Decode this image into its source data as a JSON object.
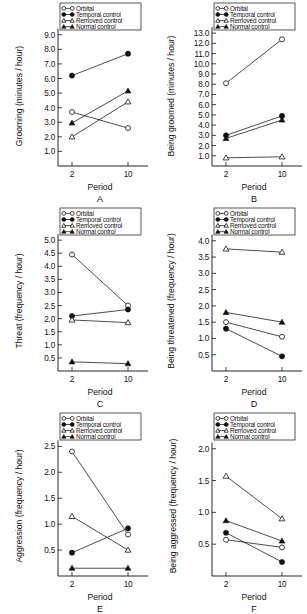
{
  "figure": {
    "series_names": [
      "Orbital",
      "Temporal control",
      "Removed control",
      "Normal control"
    ],
    "markers": [
      "open-circle",
      "filled-circle",
      "open-triangle",
      "filled-triangle"
    ],
    "x_label": "Period",
    "x_ticks": [
      "2",
      "10"
    ],
    "line_color": "#111111"
  },
  "chart_data": [
    {
      "type": "line",
      "panel": "A",
      "title": "",
      "xlabel": "Period",
      "ylabel": "Grooming (minutes / hour)",
      "x": [
        2,
        10
      ],
      "xtick_labels": [
        "2",
        "10"
      ],
      "ytick_labels": [
        "1.0",
        "2.0",
        "3.0",
        "4.0",
        "5.0",
        "6.0",
        "7.0",
        "8.0",
        "9.0"
      ],
      "yticks": [
        1.0,
        2.0,
        3.0,
        4.0,
        5.0,
        6.0,
        7.0,
        8.0,
        9.0
      ],
      "ylim": [
        0.0,
        9.6
      ],
      "grid": false,
      "legend_position": "top-left",
      "series": [
        {
          "name": "Orbital",
          "marker": "open-circle",
          "values": [
            3.7,
            2.6
          ]
        },
        {
          "name": "Temporal control",
          "marker": "filled-circle",
          "values": [
            6.2,
            7.7
          ]
        },
        {
          "name": "Removed control",
          "marker": "open-triangle",
          "values": [
            2.0,
            4.4
          ]
        },
        {
          "name": "Normal control",
          "marker": "filled-triangle",
          "values": [
            2.95,
            5.15
          ]
        }
      ]
    },
    {
      "type": "line",
      "panel": "B",
      "title": "",
      "xlabel": "Period",
      "ylabel": "Being groomed (minutes / hour)",
      "x": [
        2,
        10
      ],
      "xtick_labels": [
        "2",
        "10"
      ],
      "ytick_labels": [
        "1.0",
        "2.0",
        "3.0",
        "4.0",
        "5.0",
        "6.0",
        "7.0",
        "8.0",
        "9.0",
        "10.0",
        "11.0",
        "12.0",
        "13.0"
      ],
      "yticks": [
        1.0,
        2.0,
        3.0,
        4.0,
        5.0,
        6.0,
        7.0,
        8.0,
        9.0,
        10.0,
        11.0,
        12.0,
        13.0
      ],
      "ylim": [
        0.0,
        13.7
      ],
      "grid": false,
      "legend_position": "top-left",
      "series": [
        {
          "name": "Orbital",
          "marker": "open-circle",
          "values": [
            8.1,
            12.4
          ]
        },
        {
          "name": "Temporal control",
          "marker": "filled-circle",
          "values": [
            3.0,
            4.9
          ]
        },
        {
          "name": "Removed control",
          "marker": "open-triangle",
          "values": [
            0.8,
            0.9
          ]
        },
        {
          "name": "Normal control",
          "marker": "filled-triangle",
          "values": [
            2.7,
            4.5
          ]
        }
      ]
    },
    {
      "type": "line",
      "panel": "C",
      "title": "",
      "xlabel": "Period",
      "ylabel": "Threat (frequency / hour)",
      "x": [
        2,
        10
      ],
      "xtick_labels": [
        "2",
        "10"
      ],
      "ytick_labels": [
        "0.5",
        "1.0",
        "1.5",
        "2.0",
        "2.5",
        "3.0",
        "3.5",
        "4.0",
        "4.5",
        "5.0"
      ],
      "yticks": [
        0.5,
        1.0,
        1.5,
        2.0,
        2.5,
        3.0,
        3.5,
        4.0,
        4.5,
        5.0
      ],
      "ylim": [
        0.0,
        5.35
      ],
      "grid": false,
      "legend_position": "top-left",
      "series": [
        {
          "name": "Orbital",
          "marker": "open-circle",
          "values": [
            4.45,
            2.5
          ]
        },
        {
          "name": "Temporal control",
          "marker": "filled-circle",
          "values": [
            2.1,
            2.35
          ]
        },
        {
          "name": "Removed control",
          "marker": "open-triangle",
          "values": [
            1.95,
            1.85
          ]
        },
        {
          "name": "Normal control",
          "marker": "filled-triangle",
          "values": [
            0.35,
            0.28
          ]
        }
      ]
    },
    {
      "type": "line",
      "panel": "D",
      "title": "",
      "xlabel": "Period",
      "ylabel": "Being threatened (frequency / hour)",
      "x": [
        2,
        10
      ],
      "xtick_labels": [
        "2",
        "10"
      ],
      "ytick_labels": [
        "0.5",
        "1.0",
        "1.5",
        "2.0",
        "2.5",
        "3.0",
        "3.5",
        "4.0"
      ],
      "yticks": [
        0.5,
        1.0,
        1.5,
        2.0,
        2.5,
        3.0,
        3.5,
        4.0
      ],
      "ylim": [
        0.0,
        4.3
      ],
      "grid": false,
      "legend_position": "top-left",
      "series": [
        {
          "name": "Orbital",
          "marker": "open-circle",
          "values": [
            1.5,
            1.05
          ]
        },
        {
          "name": "Temporal control",
          "marker": "filled-circle",
          "values": [
            1.3,
            0.45
          ]
        },
        {
          "name": "Removed control",
          "marker": "open-triangle",
          "values": [
            3.75,
            3.65
          ]
        },
        {
          "name": "Normal control",
          "marker": "filled-triangle",
          "values": [
            1.8,
            1.5
          ]
        }
      ]
    },
    {
      "type": "line",
      "panel": "E",
      "title": "",
      "xlabel": "Period",
      "ylabel": "Aggression (frequency / hour)",
      "x": [
        2,
        10
      ],
      "xtick_labels": [
        "2",
        "10"
      ],
      "ytick_labels": [
        "0.5",
        "1.0",
        "1.5",
        "2.0",
        "2.5"
      ],
      "yticks": [
        0.5,
        1.0,
        1.5,
        2.0,
        2.5
      ],
      "ylim": [
        0.0,
        2.7
      ],
      "grid": false,
      "legend_position": "top-left",
      "series": [
        {
          "name": "Orbital",
          "marker": "open-circle",
          "values": [
            2.4,
            0.8
          ]
        },
        {
          "name": "Temporal control",
          "marker": "filled-circle",
          "values": [
            0.45,
            0.92
          ]
        },
        {
          "name": "Removed control",
          "marker": "open-triangle",
          "values": [
            1.15,
            0.5
          ]
        },
        {
          "name": "Normal control",
          "marker": "filled-triangle",
          "values": [
            0.15,
            0.15
          ]
        }
      ]
    },
    {
      "type": "line",
      "panel": "F",
      "title": "",
      "xlabel": "Period",
      "ylabel": "Being aggressed (frequency / hour)",
      "x": [
        2,
        10
      ],
      "xtick_labels": [
        "2",
        "10"
      ],
      "ytick_labels": [
        "0.5",
        "1.0",
        "1.5",
        "2.0"
      ],
      "yticks": [
        0.5,
        1.0,
        1.5,
        2.0
      ],
      "ylim": [
        0.0,
        2.2
      ],
      "grid": false,
      "legend_position": "top-left",
      "series": [
        {
          "name": "Orbital",
          "marker": "open-circle",
          "values": [
            0.57,
            0.45
          ]
        },
        {
          "name": "Temporal control",
          "marker": "filled-circle",
          "values": [
            0.68,
            0.22
          ]
        },
        {
          "name": "Removed control",
          "marker": "open-triangle",
          "values": [
            1.57,
            0.9
          ]
        },
        {
          "name": "Normal control",
          "marker": "filled-triangle",
          "values": [
            0.87,
            0.55
          ]
        }
      ]
    }
  ]
}
